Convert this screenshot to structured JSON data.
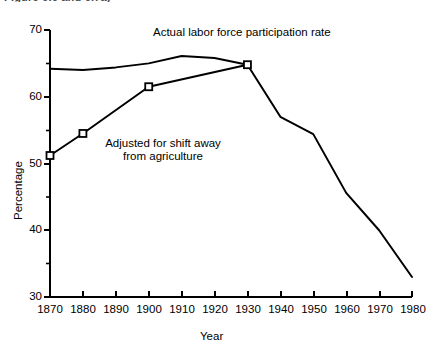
{
  "figure": {
    "clipped_top_caption": "Figure 6.6 and 6.7a)",
    "x_axis_title": "Year",
    "y_axis_title": "Percentage"
  },
  "annotations": [
    {
      "id": "actual-label",
      "text": "Actual labor force participation rate"
    },
    {
      "id": "adjusted-label-line1",
      "text": "Adjusted for shift away"
    },
    {
      "id": "adjusted-label-line2",
      "text": "from agriculture"
    }
  ],
  "chart_data": {
    "type": "line",
    "title": "",
    "xlabel": "Year",
    "ylabel": "Percentage",
    "xlim": [
      1870,
      1980
    ],
    "ylim": [
      30,
      70
    ],
    "xticks": [
      1870,
      1880,
      1890,
      1900,
      1910,
      1920,
      1930,
      1940,
      1950,
      1960,
      1970,
      1980
    ],
    "xtick_labels": [
      "1870",
      "1880",
      "1890",
      "1900",
      "1910",
      "1920",
      "1930",
      "1940",
      "1950",
      "1960",
      "1970",
      "1980"
    ],
    "yticks": [
      30,
      40,
      50,
      60,
      70
    ],
    "ytick_labels": [
      "30",
      "40",
      "50",
      "60",
      "70"
    ],
    "yminorticks": [
      35,
      45,
      55,
      65
    ],
    "grid": false,
    "legend": "none",
    "markers": "open-square",
    "line_color": "#000000",
    "series": [
      {
        "name": "Actual labor force participation rate",
        "marker": "none",
        "x": [
          1870,
          1880,
          1890,
          1900,
          1910,
          1920,
          1930,
          1940,
          1950,
          1960,
          1970,
          1980
        ],
        "values": [
          64.2,
          64.0,
          64.4,
          65.0,
          66.1,
          65.8,
          64.8,
          57.0,
          54.4,
          45.6,
          40.0,
          33.0
        ]
      },
      {
        "name": "Adjusted for shift away from agriculture",
        "marker": "open-square",
        "x": [
          1870,
          1880,
          1900,
          1930
        ],
        "values": [
          51.2,
          54.5,
          61.5,
          64.8
        ]
      }
    ]
  }
}
